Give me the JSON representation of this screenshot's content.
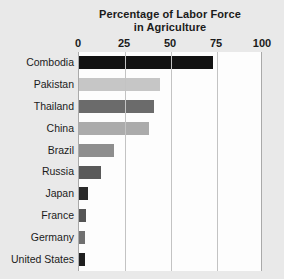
{
  "chart_data": {
    "type": "bar",
    "orientation": "horizontal",
    "title": "Percentage of Labor Force in Agriculture",
    "title_lines": [
      "Percentage of Labor Force",
      "in Agriculture"
    ],
    "xlabel": "",
    "ylabel": "",
    "xlim": [
      0,
      100
    ],
    "xticks": [
      0,
      25,
      50,
      75,
      100
    ],
    "xtick_labels": [
      "0",
      "25",
      "50",
      "75",
      "100"
    ],
    "grid": true,
    "grid_axis": "x",
    "legend": false,
    "categories": [
      "Combodia",
      "Pakistan",
      "Thailand",
      "China",
      "Brazil",
      "Russia",
      "Japan",
      "France",
      "Germany",
      "United States"
    ],
    "values": [
      73,
      44,
      41,
      38,
      19,
      12,
      5,
      4,
      3,
      3
    ],
    "bar_colors": [
      "#121212",
      "#c6c6c6",
      "#6b6b6b",
      "#ababab",
      "#8e8e8e",
      "#595959",
      "#2a2a2a",
      "#555555",
      "#707070",
      "#1f1f1f"
    ]
  },
  "colors": {
    "background": "#e9e9e9",
    "plot_background": "#fdfdfd",
    "gridline": "#c3c3c3",
    "axis_line": "#a9a9a9",
    "text": "#1b1b1b"
  }
}
